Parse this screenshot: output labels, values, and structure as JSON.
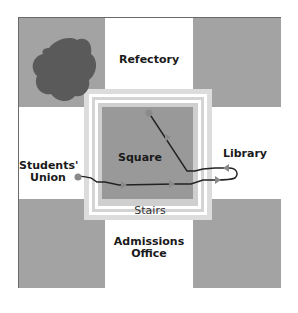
{
  "diagram": {
    "type": "campus-route-map",
    "colors": {
      "gray_block": "#a3a3a3",
      "dark_blob": "#5a5a5a",
      "square_fill": "#999999",
      "stairs_light": "#dcdcdc",
      "stairs_white": "#ffffff",
      "route_line": "#222222",
      "route_marker": "#8a8a8a",
      "frame": "#6b6b6b"
    },
    "labels": {
      "refectory": "Refectory",
      "students_union_line1": "Students'",
      "students_union_line2": "Union",
      "square": "Square",
      "library": "Library",
      "stairs": "Stairs",
      "admissions_line1": "Admissions",
      "admissions_line2": "Office"
    }
  }
}
